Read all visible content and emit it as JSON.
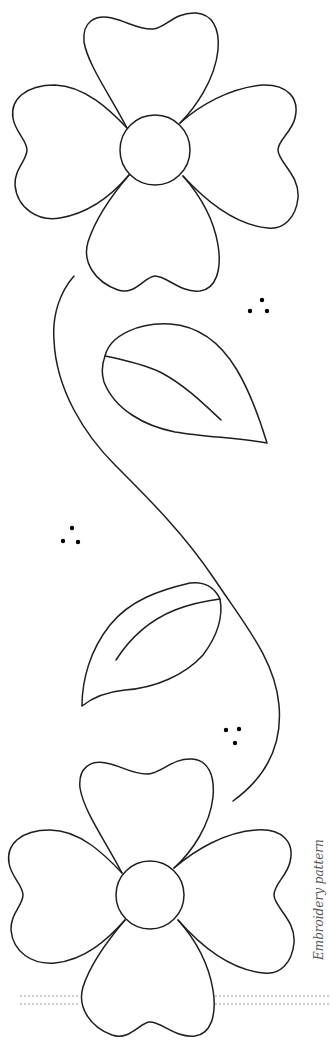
{
  "caption": "Embroidery pattern",
  "colors": {
    "background": "#ffffff",
    "line": "#1e1e1e",
    "guide": "#9a9a9a",
    "caption": "#555555"
  },
  "elements": {
    "flowers": [
      {
        "name": "top-flower",
        "center": [
          155,
          150
        ],
        "center_radius": 35,
        "petals": 4
      },
      {
        "name": "bottom-flower",
        "center": [
          150,
          895
        ],
        "center_radius": 34,
        "petals": 4
      }
    ],
    "leaves": [
      {
        "name": "upper-leaf",
        "tip": [
          267,
          443
        ]
      },
      {
        "name": "lower-leaf",
        "tip": [
          82,
          706
        ]
      }
    ],
    "dot_clusters": [
      {
        "name": "dots-upper-right",
        "dots": [
          [
            262,
            300
          ],
          [
            250,
            311
          ],
          [
            267,
            311
          ]
        ]
      },
      {
        "name": "dots-middle-left",
        "dots": [
          [
            72,
            528
          ],
          [
            63,
            541
          ],
          [
            78,
            542
          ]
        ]
      },
      {
        "name": "dots-lower-right",
        "dots": [
          [
            226,
            730
          ],
          [
            239,
            729
          ],
          [
            235,
            743
          ]
        ]
      }
    ],
    "guide_lines_y": [
      997,
      1004
    ]
  }
}
